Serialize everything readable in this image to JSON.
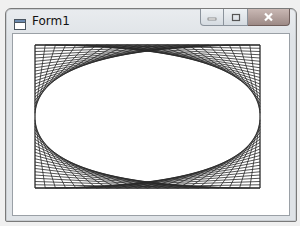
{
  "window": {
    "title": "Form1",
    "icon": "form-icon",
    "buttons": [
      {
        "name": "minimize-button",
        "icon": "minimize-icon",
        "glyph": "–"
      },
      {
        "name": "maximize-button",
        "icon": "maximize-icon",
        "glyph": "□"
      },
      {
        "name": "close-button",
        "icon": "close-icon",
        "glyph": "✕"
      }
    ]
  },
  "drawing": {
    "description": "String-art line pattern: four families of straight lines between box edges forming a lens shape",
    "box": {
      "left": 35,
      "top": 45,
      "right": 260,
      "bottom": 188
    },
    "lines_per_family": 22,
    "line_color": "#2a2a2a",
    "families": [
      {
        "name": "top-left",
        "from_edge": "top",
        "to_edge": "left"
      },
      {
        "name": "top-right",
        "from_edge": "top",
        "to_edge": "right"
      },
      {
        "name": "bottom-left",
        "from_edge": "bottom",
        "to_edge": "left"
      },
      {
        "name": "bottom-right",
        "from_edge": "bottom",
        "to_edge": "right"
      }
    ]
  }
}
